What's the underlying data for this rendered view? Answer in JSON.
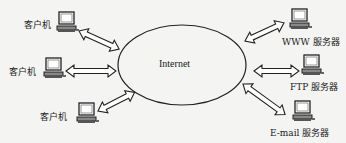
{
  "diagram": {
    "center": {
      "label": "Internet",
      "shape": "ellipse"
    },
    "clients": [
      {
        "label": "客户机",
        "icon": "computer-icon"
      },
      {
        "label": "客户机",
        "icon": "computer-icon"
      },
      {
        "label": "客户机",
        "icon": "computer-icon"
      }
    ],
    "servers": [
      {
        "label": "WWW 服务器",
        "icon": "computer-icon"
      },
      {
        "label": "FTP 服务器",
        "icon": "computer-icon"
      },
      {
        "label": "E-mail 服务器",
        "icon": "computer-icon"
      }
    ],
    "connector": "double-headed-arrow",
    "colors": {
      "background": "#f4f4f2",
      "stroke": "#222222",
      "screen": "#ffffff"
    }
  }
}
